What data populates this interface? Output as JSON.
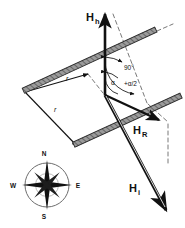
{
  "figure": {
    "background_color": "#ffffff",
    "ink_color": "#111111",
    "bar_color": "#8a8a8a",
    "bar_edge_color": "#2b2b2b"
  },
  "vectors": [
    {
      "id": "Hh",
      "base": "H",
      "subscript": "h",
      "label": "Hh",
      "description": "horizontal-component vector pointing up",
      "x1": 105,
      "y1": 95,
      "x2": 105,
      "y2": 12,
      "label_x": 92,
      "label_y": 16
    },
    {
      "id": "HR",
      "base": "H",
      "subscript": "R",
      "label": "HR",
      "description": "resultant vector pointing lower-right",
      "x1": 105,
      "y1": 95,
      "x2": 162,
      "y2": 122,
      "label_x": 139,
      "label_y": 131
    },
    {
      "id": "Hi",
      "base": "H",
      "subscript": "i",
      "label": "Hi",
      "description": "inclination vector pointing lower-right steeply down",
      "x1": 105,
      "y1": 95,
      "x2": 168,
      "y2": 213,
      "label_x": 134,
      "label_y": 189
    }
  ],
  "angles": [
    {
      "id": "angle-90",
      "label": "90°",
      "x": 130,
      "y": 68
    },
    {
      "id": "angle-alpha",
      "label": "α",
      "x": 114,
      "y": 83
    },
    {
      "id": "angle-half-alpha",
      "label": "+α/2",
      "x": 131,
      "y": 84
    }
  ],
  "radii": [
    {
      "id": "r-upper",
      "label": "r",
      "x": 68,
      "y": 79
    },
    {
      "id": "r-lower",
      "label": "r",
      "x": 56,
      "y": 110
    }
  ],
  "bars": [
    {
      "id": "bar-upper",
      "description": "upper hatched bar running lower-left to upper-right",
      "x1": 25,
      "y1": 92,
      "x2": 157,
      "y2": 31
    },
    {
      "id": "bar-lower",
      "description": "lower hatched bar running lower-left to upper-right",
      "x1": 75,
      "y1": 145,
      "x2": 180,
      "y2": 97
    }
  ],
  "dashed_lines": [
    {
      "id": "dash-from-Hh-tip",
      "x1": 113,
      "y1": 14,
      "x2": 146,
      "y2": 101
    },
    {
      "id": "dash-bar-extension-upper",
      "x1": 157,
      "y1": 31,
      "x2": 171,
      "y2": 25
    },
    {
      "id": "dash-right-vertical",
      "x1": 168,
      "y1": 123,
      "x2": 168,
      "y2": 165
    },
    {
      "id": "dash-short-left",
      "x1": 88,
      "y1": 75,
      "x2": 104,
      "y2": 94
    }
  ],
  "compass": {
    "id": "compass-rose",
    "center_x": 47,
    "center_y": 185,
    "radius": 22,
    "points": [
      {
        "dir": "N",
        "label": "N",
        "x": 47,
        "y": 155
      },
      {
        "dir": "E",
        "label": "E",
        "x": 78,
        "y": 186
      },
      {
        "dir": "S",
        "label": "S",
        "x": 47,
        "y": 216
      },
      {
        "dir": "W",
        "label": "W",
        "x": 15,
        "y": 186
      }
    ]
  }
}
